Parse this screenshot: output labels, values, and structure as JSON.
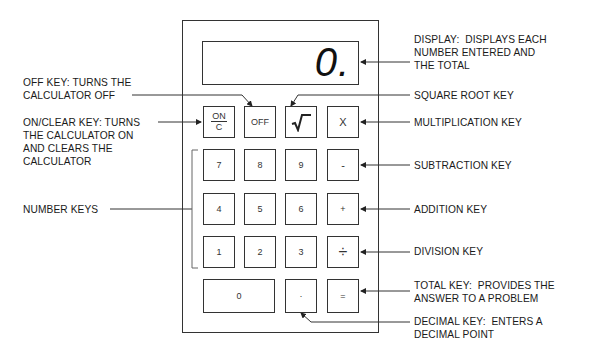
{
  "diagram": {
    "display": {
      "value": "0."
    },
    "keys": {
      "row1": [
        {
          "id": "on-clear",
          "top": "ON",
          "bottom": "C"
        },
        {
          "id": "off",
          "label": "OFF"
        },
        {
          "id": "sqrt",
          "label": "√‾"
        },
        {
          "id": "multiply",
          "label": "X"
        }
      ],
      "row2": [
        {
          "label": "7"
        },
        {
          "label": "8"
        },
        {
          "label": "9"
        },
        {
          "label": "-"
        }
      ],
      "row3": [
        {
          "label": "4"
        },
        {
          "label": "5"
        },
        {
          "label": "6"
        },
        {
          "label": "+"
        }
      ],
      "row4": [
        {
          "label": "1"
        },
        {
          "label": "2"
        },
        {
          "label": "3"
        },
        {
          "label": "÷"
        }
      ],
      "row5": [
        {
          "label": "0"
        },
        {
          "label": "·"
        },
        {
          "label": "="
        }
      ]
    },
    "callouts": {
      "display": "DISPLAY:  DISPLAYS EACH\nNUMBER ENTERED AND\nTHE TOTAL",
      "off_key": "OFF KEY: TURNS THE\nCALCULATOR OFF",
      "square_root_key": "SQUARE ROOT KEY",
      "on_clear_key": "ON/CLEAR KEY: TURNS\nTHE CALCULATOR ON\nAND CLEARS THE\nCALCULATOR",
      "multiplication_key": "MULTIPLICATION KEY",
      "subtraction_key": "SUBTRACTION KEY",
      "number_keys": "NUMBER KEYS",
      "addition_key": "ADDITION KEY",
      "division_key": "DIVISION KEY",
      "total_key": "TOTAL KEY:  PROVIDES THE\nANSWER TO A PROBLEM",
      "decimal_key": "DECIMAL KEY:  ENTERS A\nDECIMAL POINT"
    },
    "colors": {
      "line": "#333333",
      "text": "#1a1a1a",
      "background": "#ffffff"
    }
  }
}
